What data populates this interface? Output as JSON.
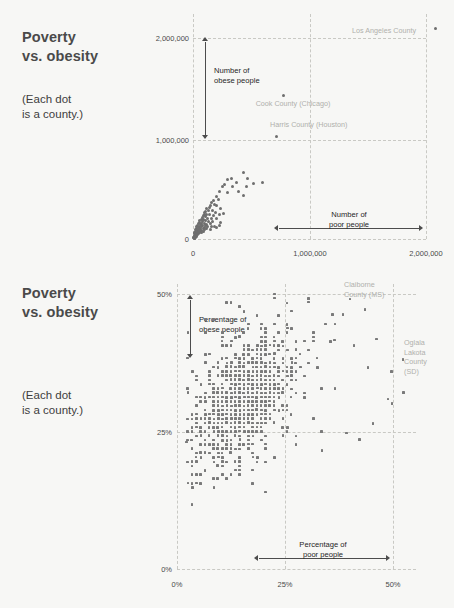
{
  "page": {
    "background": "#f7f7f5",
    "dot_color": "#6e6e6e",
    "gridline_color": "#c9c9c4",
    "callout_color": "#b0b0ac"
  },
  "panels": [
    {
      "id": "absolute-counts",
      "title": "Poverty\nvs. obesity",
      "title_line1": "Poverty",
      "title_line2": "vs. obesity",
      "subtitle_line1": "(Each dot",
      "subtitle_line2": "is a county.)",
      "y_arrow_label_line1": "Number of",
      "y_arrow_label_line2": "obese people",
      "x_arrow_label_line1": "Number of",
      "x_arrow_label_line2": "poor people",
      "y_ticks": [
        "0",
        "1,000,000",
        "2,000,000"
      ],
      "x_ticks": [
        "0",
        "1,000,000",
        "2,000,000"
      ],
      "callouts": [
        {
          "name": "los-angeles-county",
          "text": "Los Angeles County"
        },
        {
          "name": "cook-county-chicago",
          "text": "Cook County (Chicago)"
        },
        {
          "name": "harris-county-houston",
          "text": "Harris County (Houston)"
        }
      ]
    },
    {
      "id": "percentages",
      "title_line1": "Poverty",
      "title_line2": "vs. obesity",
      "subtitle_line1": "(Each dot",
      "subtitle_line2": "is a county.)",
      "y_arrow_label_line1": "Percentage of",
      "y_arrow_label_line2": "obese people",
      "x_arrow_label_line1": "Percentage of",
      "x_arrow_label_line2": "poor people",
      "y_ticks": [
        "0%",
        "25%",
        "50%"
      ],
      "x_ticks": [
        "0%",
        "25%",
        "50%"
      ],
      "callouts": [
        {
          "name": "claiborne-county-ms",
          "text": "Claiborne\nCounty (MS)"
        },
        {
          "name": "oglala-lakota-county-sd",
          "text": "Oglala\nLakota\nCounty\n(SD)"
        }
      ]
    }
  ],
  "chart_data": [
    {
      "type": "scatter",
      "title": "Poverty vs. obesity",
      "subtitle": "(Each dot is a county.)",
      "xlabel": "Number of poor people",
      "ylabel": "Number of obese people",
      "xlim": [
        0,
        2200000
      ],
      "ylim": [
        0,
        2150000
      ],
      "xticks": [
        0,
        1000000,
        2000000
      ],
      "xticklabels": [
        "0",
        "1,000,000",
        "2,000,000"
      ],
      "yticks": [
        0,
        1000000,
        2000000
      ],
      "yticklabels": [
        "0",
        "1,000,000",
        "2,000,000"
      ],
      "grid": true,
      "legend": "none",
      "annotations": [
        {
          "label": "Los Angeles County",
          "x": 2080000,
          "y": 2090000
        },
        {
          "label": "Cook County (Chicago)",
          "x": 780000,
          "y": 1430000
        },
        {
          "label": "Harris County (Houston)",
          "x": 720000,
          "y": 1020000
        }
      ],
      "points": [
        [
          2080000,
          2090000
        ],
        [
          780000,
          1430000
        ],
        [
          720000,
          1020000
        ],
        [
          430000,
          665000
        ],
        [
          330000,
          600000
        ],
        [
          300000,
          590000
        ],
        [
          375000,
          565000
        ],
        [
          470000,
          600000
        ],
        [
          520000,
          555000
        ],
        [
          600000,
          560000
        ],
        [
          455000,
          520000
        ],
        [
          340000,
          520000
        ],
        [
          270000,
          545000
        ],
        [
          250000,
          520000
        ],
        [
          225000,
          470000
        ],
        [
          300000,
          460000
        ],
        [
          390000,
          470000
        ],
        [
          430000,
          430000
        ],
        [
          200000,
          420000
        ],
        [
          215000,
          395000
        ],
        [
          175000,
          380000
        ],
        [
          160000,
          360000
        ],
        [
          185000,
          340000
        ],
        [
          150000,
          330000
        ],
        [
          140000,
          315000
        ],
        [
          205000,
          330000
        ],
        [
          235000,
          300000
        ],
        [
          120000,
          300000
        ],
        [
          130000,
          285000
        ],
        [
          110000,
          275000
        ],
        [
          165000,
          280000
        ],
        [
          190000,
          265000
        ],
        [
          100000,
          262000
        ],
        [
          95000,
          245000
        ],
        [
          120000,
          240000
        ],
        [
          145000,
          240000
        ],
        [
          175000,
          230000
        ],
        [
          225000,
          245000
        ],
        [
          265000,
          255000
        ],
        [
          88000,
          230000
        ],
        [
          105000,
          222000
        ],
        [
          78000,
          210000
        ],
        [
          125000,
          205000
        ],
        [
          155000,
          200000
        ],
        [
          200000,
          205000
        ],
        [
          70000,
          195000
        ],
        [
          92000,
          190000
        ],
        [
          110000,
          182000
        ],
        [
          60000,
          180000
        ],
        [
          82000,
          172000
        ],
        [
          135000,
          175000
        ],
        [
          170000,
          170000
        ],
        [
          52000,
          165000
        ],
        [
          72000,
          158000
        ],
        [
          98000,
          155000
        ],
        [
          118000,
          148000
        ],
        [
          148000,
          150000
        ],
        [
          45000,
          150000
        ],
        [
          62000,
          142000
        ],
        [
          85000,
          138000
        ],
        [
          105000,
          132000
        ],
        [
          38000,
          135000
        ],
        [
          55000,
          128000
        ],
        [
          75000,
          122000
        ],
        [
          95000,
          118000
        ],
        [
          128000,
          125000
        ],
        [
          160000,
          128000
        ],
        [
          32000,
          120000
        ],
        [
          48000,
          112000
        ],
        [
          66000,
          108000
        ],
        [
          86000,
          102000
        ],
        [
          112000,
          105000
        ],
        [
          28000,
          105000
        ],
        [
          42000,
          98000
        ],
        [
          58000,
          92000
        ],
        [
          76000,
          88000
        ],
        [
          98000,
          90000
        ],
        [
          24000,
          90000
        ],
        [
          36000,
          84000
        ],
        [
          50000,
          78000
        ],
        [
          66000,
          74000
        ],
        [
          86000,
          76000
        ],
        [
          20000,
          76000
        ],
        [
          31000,
          70000
        ],
        [
          44000,
          65000
        ],
        [
          58000,
          62000
        ],
        [
          74000,
          64000
        ],
        [
          17000,
          62000
        ],
        [
          26000,
          57000
        ],
        [
          37000,
          53000
        ],
        [
          50000,
          50000
        ],
        [
          14000,
          50000
        ],
        [
          22000,
          45000
        ],
        [
          31000,
          42000
        ],
        [
          42000,
          40000
        ],
        [
          11000,
          38000
        ],
        [
          18000,
          34000
        ],
        [
          25000,
          31000
        ],
        [
          34000,
          30000
        ],
        [
          9000,
          28000
        ],
        [
          14000,
          24000
        ],
        [
          20000,
          22000
        ],
        [
          28000,
          21000
        ],
        [
          7000,
          18000
        ],
        [
          11000,
          15000
        ],
        [
          16000,
          14000
        ],
        [
          22000,
          13000
        ],
        [
          5000,
          10000
        ],
        [
          9000,
          8000
        ],
        [
          13000,
          7000
        ],
        [
          205000,
          115000
        ],
        [
          240000,
          160000
        ],
        [
          185000,
          120000
        ],
        [
          150000,
          95000
        ],
        [
          225000,
          135000
        ]
      ]
    },
    {
      "type": "scatter",
      "title": "Poverty vs. obesity",
      "subtitle": "(Each dot is a county.)",
      "xlabel": "Percentage of poor people",
      "ylabel": "Percentage of obese people",
      "xlim": [
        0,
        55
      ],
      "ylim": [
        0,
        52
      ],
      "xticks": [
        0,
        25,
        50
      ],
      "xticklabels": [
        "0%",
        "25%",
        "50%"
      ],
      "yticks": [
        0,
        25,
        50
      ],
      "yticklabels": [
        "0%",
        "25%",
        "50%"
      ],
      "grid": true,
      "legend": "none",
      "annotations": [
        {
          "label": "Claiborne County (MS)",
          "x": 40,
          "y": 49.5
        },
        {
          "label": "Oglala Lakota County (SD)",
          "x": 52,
          "y": 38
        }
      ],
      "note": "Dense lattice of ~3000 US counties; x = poverty rate, y = obesity rate. Cloud centered near (16%, 31%), positive correlation, spread 3-50% poverty and 11-50% obesity.",
      "cloud": {
        "x_center": 16,
        "y_center": 30.5,
        "x_range": [
          2,
          50
        ],
        "y_range": [
          11,
          50
        ],
        "correlation": 0.45
      }
    }
  ]
}
